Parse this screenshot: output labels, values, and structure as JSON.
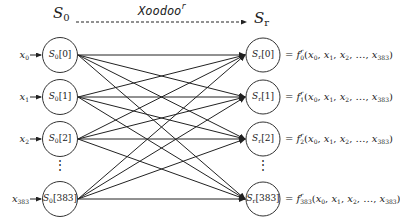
{
  "diagram": {
    "left_header": {
      "symbol": "S",
      "subscript": "0"
    },
    "right_header": {
      "symbol": "S",
      "subscript": "r"
    },
    "transform_label": {
      "name": "Xoodoo",
      "superscript": "r"
    },
    "left_nodes": [
      {
        "input_var": "x",
        "input_sub": "0",
        "label": "S",
        "label_sub": "0",
        "index": "[0]"
      },
      {
        "input_var": "x",
        "input_sub": "1",
        "label": "S",
        "label_sub": "0",
        "index": "[1]"
      },
      {
        "input_var": "x",
        "input_sub": "2",
        "label": "S",
        "label_sub": "0",
        "index": "[2]"
      },
      {
        "input_var": "x",
        "input_sub": "383",
        "label": "S",
        "label_sub": "0",
        "index": "[383]"
      }
    ],
    "right_nodes": [
      {
        "label": "S",
        "label_sub": "r",
        "index": "[0]",
        "func": "f",
        "func_sub": "0",
        "func_sup": "r"
      },
      {
        "label": "S",
        "label_sub": "r",
        "index": "[1]",
        "func": "f",
        "func_sub": "1",
        "func_sup": "r"
      },
      {
        "label": "S",
        "label_sub": "r",
        "index": "[2]",
        "func": "f",
        "func_sub": "2",
        "func_sup": "r"
      },
      {
        "label": "S",
        "label_sub": "r",
        "index": "[383]",
        "func": "f",
        "func_sub": "383",
        "func_sup": "r"
      }
    ],
    "equation": {
      "equals": "=",
      "open": "(",
      "close": ")",
      "args": [
        {
          "var": "x",
          "sub": "0"
        },
        {
          "var": "x",
          "sub": "1"
        },
        {
          "var": "x",
          "sub": "2"
        },
        {
          "var": "…",
          "sub": ""
        },
        {
          "var": "x",
          "sub": "383"
        }
      ]
    },
    "ellipsis_vertical": "⋮",
    "colors": {
      "stroke": "#222222",
      "background": "#ffffff"
    }
  }
}
